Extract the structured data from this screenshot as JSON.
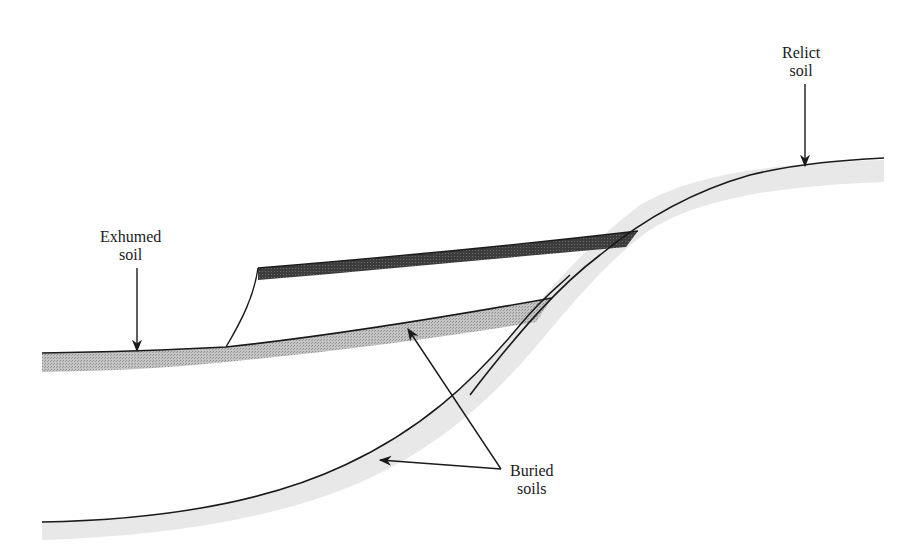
{
  "diagram": {
    "type": "geologic cross-section",
    "labels": {
      "relict": {
        "line1": "Relict",
        "line2": "soil"
      },
      "exhumed": {
        "line1": "Exhumed",
        "line2": "soil"
      },
      "buried": {
        "line1": "Buried",
        "line2": "soils"
      }
    },
    "colors": {
      "line": "#1a1a1a",
      "dark_soil": "#3a3a3a",
      "light_soil": "#b8b8b8",
      "soft_shade": "#e2e2e2",
      "background": "#ffffff"
    }
  }
}
